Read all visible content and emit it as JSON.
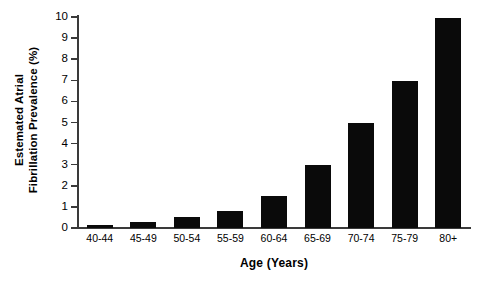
{
  "chart_data": {
    "type": "bar",
    "title": "",
    "subtitle": "",
    "xlabel": "Age (Years)",
    "ylabel": "Estemated Atrial Fibrillation Prevalence (%)",
    "ylabel_lines": [
      "Estemated Atrial",
      "Fibrillation Prevalence (%)"
    ],
    "categories": [
      "40-44",
      "45-49",
      "50-54",
      "55-59",
      "60-64",
      "65-69",
      "70-74",
      "75-79",
      "80+"
    ],
    "values": [
      0.15,
      0.3,
      0.5,
      0.8,
      1.5,
      3.0,
      5.0,
      6.95,
      9.95
    ],
    "ylim": [
      0,
      10
    ],
    "ytick_labels": [
      "0",
      "1",
      "2",
      "3",
      "4",
      "5",
      "6",
      "7",
      "8",
      "9",
      "10"
    ],
    "ytick_values": [
      0,
      1,
      2,
      3,
      4,
      5,
      6,
      7,
      8,
      9,
      10
    ],
    "grid": false,
    "legend": "none",
    "bar_color": "#0a0a0a",
    "axis_color": "#3a3a3a",
    "background_color": "#ffffff"
  }
}
